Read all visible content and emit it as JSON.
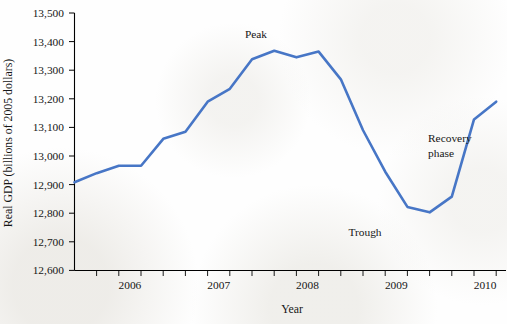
{
  "chart_data": {
    "type": "line",
    "title": "",
    "xlabel": "Year",
    "ylabel": "Real GDP (billions of 2005 dollars)",
    "ylim": [
      12600,
      13500
    ],
    "ytick_labels": [
      "13,500",
      "13,400",
      "13,300",
      "13,200",
      "13,100",
      "13,000",
      "12,900",
      "12,800",
      "12,700",
      "12,600"
    ],
    "ytick_values": [
      13500,
      13400,
      13300,
      13200,
      13100,
      13000,
      12900,
      12800,
      12700,
      12600
    ],
    "xlim": [
      2005.75,
      2010.5
    ],
    "xtick_labels": [
      "2006",
      "2007",
      "2008",
      "2009",
      "2010"
    ],
    "xtick_values": [
      2006,
      2007,
      2008,
      2009,
      2010
    ],
    "minor_tick_interval_years": 0.25,
    "grid": false,
    "legend": false,
    "series": [
      {
        "name": "Real GDP",
        "color": "#4776C6",
        "x": [
          2005.75,
          2006.0,
          2006.25,
          2006.5,
          2006.75,
          2007.0,
          2007.25,
          2007.5,
          2007.75,
          2008.0,
          2008.25,
          2008.5,
          2008.75,
          2009.0,
          2009.25,
          2009.5,
          2009.75,
          2010.0,
          2010.25,
          2010.5
        ],
        "values": [
          12908,
          12940,
          12966,
          12966,
          13060,
          13085,
          13190,
          13235,
          13338,
          13368,
          13345,
          13365,
          13268,
          13090,
          12945,
          12822,
          12803,
          12858,
          13128,
          13190
        ]
      }
    ],
    "annotations": [
      {
        "text": "Peak",
        "x": 2007.6,
        "y": 13420,
        "lines": [
          "Peak"
        ]
      },
      {
        "text": "Trough",
        "x": 2009.0,
        "y": 12728,
        "lines": [
          "Trough"
        ]
      },
      {
        "text": "Recovery phase",
        "x": 2009.95,
        "y": 13075,
        "lines": [
          "Recovery",
          "phase"
        ]
      }
    ]
  },
  "axes": {
    "y_axis_title": "Real GDP (billions of 2005 dollars)",
    "x_axis_title": "Year"
  }
}
